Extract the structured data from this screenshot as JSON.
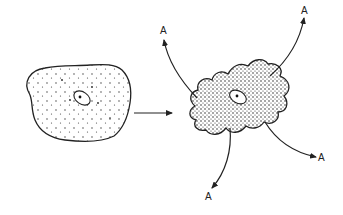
{
  "diagram": {
    "left_cell": {
      "label": "",
      "stipple": "sparse"
    },
    "transition_arrow": {
      "direction": "right"
    },
    "right_cell": {
      "label": "",
      "stipple": "dense"
    },
    "outputs": [
      {
        "label": "A",
        "position": "top-left"
      },
      {
        "label": "A",
        "position": "top-right"
      },
      {
        "label": "A",
        "position": "bottom"
      },
      {
        "label": "A",
        "position": "bottom-right"
      }
    ],
    "colors": {
      "ink": "#222222",
      "background": "#ffffff"
    }
  }
}
